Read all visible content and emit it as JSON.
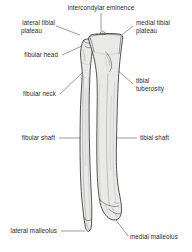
{
  "figure": {
    "background_color": "#ffffff",
    "text_color": "#2a2a2a",
    "leader_color": "#4a4a4a",
    "bone_fill_color": "#e9e9e7",
    "bone_outline_color": "#1e1e1e"
  },
  "labels": {
    "intercondylar_eminence": "intercondylar eminence",
    "lateral_tibial_plateau_line1": "lateral tibial",
    "lateral_tibial_plateau_line2": "plateau",
    "medial_tibial_plateau_line1": "medial tibial",
    "medial_tibial_plateau_line2": "plateau",
    "fibular_head": "fibular head",
    "tibial_tuberosity_line1": "tibial",
    "tibial_tuberosity_line2": "tuberosity",
    "fibular_neck": "fibular neck",
    "fibular_shaft": "fibular shaft",
    "tibial_shaft": "tibial shaft",
    "lateral_malleolus": "lateral malleolus",
    "medial_malleolus": "medial malleolus"
  },
  "structures": [
    {
      "name": "tibia",
      "label": "tibial shaft"
    },
    {
      "name": "fibula",
      "label": "fibular shaft"
    }
  ]
}
